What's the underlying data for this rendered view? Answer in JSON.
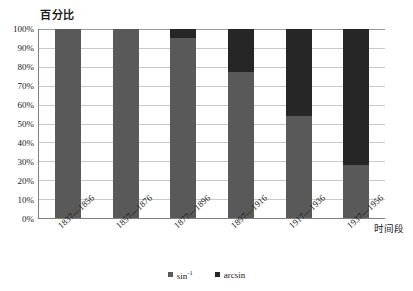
{
  "chart_data": {
    "type": "bar",
    "subtype": "100% stacked column",
    "title": "",
    "ylabel": "百分比",
    "xlabel": "时间段",
    "categories": [
      "1837—1856",
      "1857—1876",
      "1877—1896",
      "1897—1916",
      "1917—1936",
      "1937—1956"
    ],
    "series": [
      {
        "name": "sin-1",
        "label": "sin",
        "exponent": "-1",
        "color": "#595959",
        "values": [
          100,
          100,
          95,
          77,
          54,
          28
        ]
      },
      {
        "name": "arcsin",
        "label": "arcsin",
        "color": "#262626",
        "values": [
          0,
          0,
          5,
          23,
          46,
          72
        ]
      }
    ],
    "ylim": [
      0,
      100
    ],
    "yticks": [
      "100%",
      "90%",
      "80%",
      "70%",
      "60%",
      "50%",
      "40%",
      "30%",
      "20%",
      "10%",
      "0%"
    ],
    "ytick_values": [
      100,
      90,
      80,
      70,
      60,
      50,
      40,
      30,
      20,
      10,
      0
    ],
    "grid": true,
    "legend_position": "bottom"
  },
  "axes": {
    "y_title": "百分比",
    "x_title": "时间段"
  },
  "legend": {
    "items": [
      {
        "label_main": "sin",
        "label_sup": "-1",
        "color": "#595959"
      },
      {
        "label_main": "arcsin",
        "label_sup": "",
        "color": "#262626"
      }
    ]
  },
  "colors": {
    "series_sin": "#595959",
    "series_arcsin": "#262626",
    "gridline": "#c9c9c9",
    "axis": "#7f7f7f",
    "background": "#ffffff"
  }
}
